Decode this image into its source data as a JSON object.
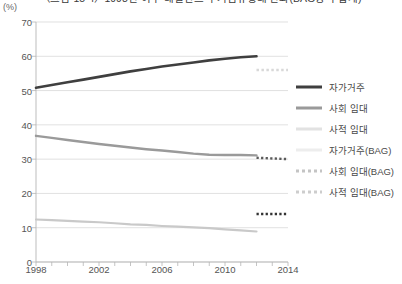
{
  "chart_data": {
    "type": "line",
    "title": "〈그림 15-4〉1998년 이후 네덜란드 주거점유형태 변화(BAG방식 합계)",
    "unit_label": "(%)",
    "xlabel": "",
    "ylabel": "",
    "ylim": [
      0,
      70
    ],
    "xlim": [
      1998,
      2014
    ],
    "ytick_labels": [
      "0",
      "10",
      "20",
      "30",
      "40",
      "50",
      "60",
      "70"
    ],
    "ytick_values": [
      0,
      10,
      20,
      30,
      40,
      50,
      60,
      70
    ],
    "xtick_labels": [
      "1998",
      "2002",
      "2006",
      "2010",
      "2014"
    ],
    "xtick_values": [
      1998,
      2002,
      2006,
      2010,
      2014
    ],
    "x_minor_ticks": [
      1998,
      1999,
      2000,
      2001,
      2002,
      2003,
      2004,
      2005,
      2006,
      2007,
      2008,
      2009,
      2010,
      2011,
      2012,
      2013,
      2014
    ],
    "grid": "horizontal",
    "legend_position": "right",
    "series": [
      {
        "name": "자가거주",
        "style": "solid",
        "color": "#3f3f3f",
        "width": 2.6,
        "x": [
          1998,
          1999,
          2000,
          2001,
          2002,
          2003,
          2004,
          2005,
          2006,
          2007,
          2008,
          2009,
          2010,
          2011,
          2012
        ],
        "values": [
          50.8,
          51.6,
          52.4,
          53.2,
          54.0,
          54.8,
          55.6,
          56.3,
          57.0,
          57.6,
          58.2,
          58.8,
          59.3,
          59.7,
          60.0
        ]
      },
      {
        "name": "사회 임대",
        "style": "solid",
        "color": "#9a9a9a",
        "width": 2.4,
        "x": [
          1998,
          1999,
          2000,
          2001,
          2002,
          2003,
          2004,
          2005,
          2006,
          2007,
          2008,
          2009,
          2010,
          2011,
          2012
        ],
        "values": [
          36.8,
          36.2,
          35.6,
          35.0,
          34.4,
          33.9,
          33.4,
          32.9,
          32.5,
          32.1,
          31.6,
          31.3,
          31.2,
          31.2,
          31.1
        ]
      },
      {
        "name": "사적 임대",
        "style": "solid",
        "color": "#c9c9c9",
        "width": 2.2,
        "x": [
          1998,
          1999,
          2000,
          2001,
          2002,
          2003,
          2004,
          2005,
          2006,
          2007,
          2008,
          2009,
          2010,
          2011,
          2012
        ],
        "values": [
          12.4,
          12.2,
          12.0,
          11.8,
          11.6,
          11.3,
          11.0,
          10.8,
          10.5,
          10.3,
          10.1,
          9.9,
          9.5,
          9.2,
          8.9
        ]
      },
      {
        "name": "자가거주(BAG)",
        "style": "dotted",
        "color": "#d8d8d8",
        "width": 2.6,
        "x": [
          2012,
          2013,
          2014
        ],
        "values": [
          56.0,
          56.0,
          56.0
        ]
      },
      {
        "name": "사회 임대(BAG)",
        "style": "dotted",
        "color": "#5a5a5a",
        "width": 2.4,
        "x": [
          2012,
          2013,
          2014
        ],
        "values": [
          30.4,
          30.2,
          30.0
        ]
      },
      {
        "name": "사적 임대(BAG)",
        "style": "dotted",
        "color": "#333333",
        "width": 2.4,
        "x": [
          2012,
          2013,
          2014
        ],
        "values": [
          14.0,
          14.0,
          14.0
        ]
      }
    ]
  },
  "legend": [
    {
      "label": "자가거주",
      "color": "#3f3f3f",
      "style": "solid",
      "thickness": 3
    },
    {
      "label": "사회 임대",
      "color": "#9a9a9a",
      "style": "solid",
      "thickness": 3
    },
    {
      "label": "사적 임대",
      "color": "#e2e2e2",
      "style": "solid",
      "thickness": 3
    },
    {
      "label": "자가거주(BAG)",
      "color": "#ededed",
      "style": "solid",
      "thickness": 3
    },
    {
      "label": "사회 임대(BAG)",
      "color": "#c4c4c4",
      "style": "dotted",
      "thickness": 3
    },
    {
      "label": "사적 임대(BAG)",
      "color": "#cdcdcd",
      "style": "dotted",
      "thickness": 3
    }
  ]
}
